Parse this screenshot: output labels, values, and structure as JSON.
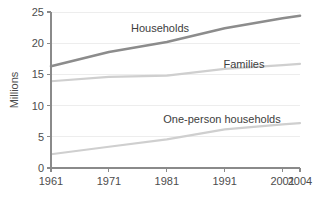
{
  "chart_data": {
    "type": "line",
    "title": "",
    "subtitle": "",
    "xlabel": "",
    "ylabel": "Millions",
    "x": [
      1961,
      1971,
      1981,
      1991,
      2001,
      2004
    ],
    "xtick_labels": [
      "1961",
      "1971",
      "1981",
      "1991",
      "2001",
      "2004"
    ],
    "ytick_labels": [
      "0",
      "5",
      "10",
      "15",
      "20",
      "25"
    ],
    "yticks": [
      0,
      5,
      10,
      15,
      20,
      25
    ],
    "xlim": [
      1961,
      2004
    ],
    "ylim": [
      0,
      25
    ],
    "grid": "horizontal",
    "legend": "inline-labels",
    "series": [
      {
        "name": "Households",
        "label": "Households",
        "color": "#8c8c8c",
        "width": 2.6,
        "values": [
          16.3,
          18.6,
          20.2,
          22.4,
          24.0,
          24.4
        ]
      },
      {
        "name": "Families",
        "label": "Families",
        "color": "#cfcfcf",
        "width": 2.2,
        "values": [
          13.9,
          14.6,
          14.8,
          15.9,
          16.5,
          16.7
        ]
      },
      {
        "name": "One-person households",
        "label": "One-person households",
        "color": "#cfcfcf",
        "width": 2.2,
        "values": [
          2.2,
          3.4,
          4.6,
          6.2,
          7.0,
          7.2
        ]
      }
    ],
    "annotations": [
      {
        "text": "Households",
        "x": 160,
        "y": 32
      },
      {
        "text": "Families",
        "x": 244,
        "y": 68
      },
      {
        "text": "One-person households",
        "x": 222,
        "y": 123
      }
    ],
    "axis_color": "#8a8a8a",
    "grid_color": "#ededed",
    "text_color": "#4d4d4d",
    "background": "#ffffff"
  },
  "plot_geometry": {
    "left": 51,
    "right": 300,
    "top": 12,
    "bottom": 168
  }
}
